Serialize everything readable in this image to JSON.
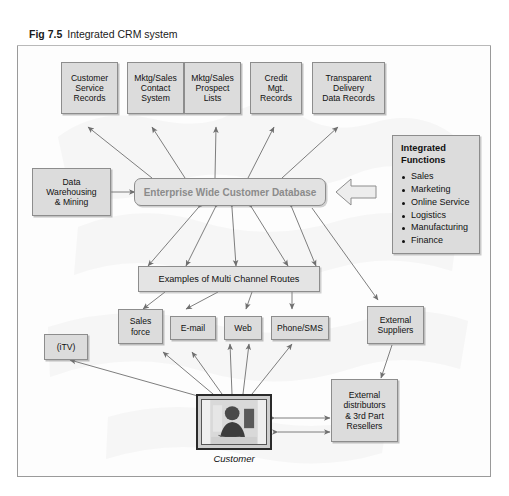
{
  "figure": {
    "number": "Fig 7.5",
    "caption": "Integrated CRM system"
  },
  "sources": [
    {
      "id": "customer-service-records",
      "label": "Customer\nService\nRecords"
    },
    {
      "id": "mktg-sales-contact-system",
      "label": "Mktg/Sales\nContact\nSystem"
    },
    {
      "id": "mktg-sales-prospect-lists",
      "label": "Mktg/Sales\nProspect\nLists"
    },
    {
      "id": "credit-mgt-records",
      "label": "Credit\nMgt.\nRecords"
    },
    {
      "id": "transparent-delivery-data-records",
      "label": "Transparent\nDelivery\nData Records"
    }
  ],
  "database": {
    "label": "Enterprise Wide Customer Database"
  },
  "data_warehousing": {
    "label": "Data\nWarehousing\n& Mining"
  },
  "integrated_functions": {
    "title": "Integrated\nFunctions",
    "items": [
      "Sales",
      "Marketing",
      "Online Service",
      "Logistics",
      "Manufacturing",
      "Finance"
    ]
  },
  "routes": {
    "label": "Examples of Multi Channel Routes"
  },
  "channels": [
    {
      "id": "itv",
      "label": "(iTV)"
    },
    {
      "id": "sales-force",
      "label": "Sales\nforce"
    },
    {
      "id": "email",
      "label": "E-mail"
    },
    {
      "id": "web",
      "label": "Web"
    },
    {
      "id": "phone-sms",
      "label": "Phone/SMS"
    }
  ],
  "external_suppliers": {
    "label": "External\nSuppliers"
  },
  "external_distributors": {
    "label": "External\ndistributors\n& 3rd Part\nResellers"
  },
  "customer": {
    "label": "Customer"
  },
  "colors": {
    "box_fill": "#dcdcdc",
    "box_border": "#8d8d8d",
    "db_text": "#8b8b8b",
    "frame_border": "#9a9a9a",
    "arrow": "#6f6f6f"
  }
}
